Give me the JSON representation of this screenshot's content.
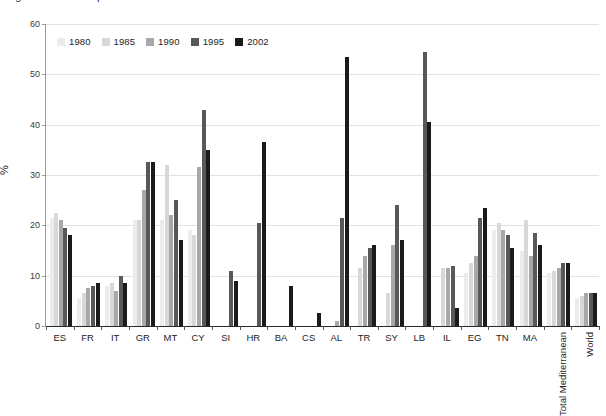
{
  "caption": {
    "text": "Figure 6.  Share of protected areas in the Mediterranean countries"
  },
  "chart_data": {
    "type": "bar",
    "title": "",
    "xlabel": "",
    "ylabel": "%",
    "ylim": [
      0,
      60
    ],
    "yticks": [
      0,
      10,
      20,
      30,
      40,
      50,
      60
    ],
    "grid": true,
    "legend_position": "top-left",
    "categories": [
      "ES",
      "FR",
      "IT",
      "GR",
      "MT",
      "CY",
      "SI",
      "HR",
      "BA",
      "CS",
      "AL",
      "TR",
      "SY",
      "LB",
      "IL",
      "EG",
      "TN",
      "MA",
      "Total Mediterranean",
      "World"
    ],
    "rotated_categories": [
      "Total Mediterranean",
      "World"
    ],
    "series": [
      {
        "name": "1980",
        "color": "#ececec",
        "values": [
          21.5,
          5.5,
          8.0,
          21.0,
          21.0,
          19.0,
          null,
          null,
          null,
          null,
          null,
          null,
          null,
          null,
          null,
          10.5,
          19.0,
          15.0,
          10.5,
          5.5
        ]
      },
      {
        "name": "1985",
        "color": "#d8d8d8",
        "values": [
          22.5,
          6.5,
          8.5,
          21.0,
          32.0,
          18.0,
          null,
          null,
          null,
          null,
          null,
          11.5,
          6.5,
          null,
          11.5,
          12.5,
          20.5,
          21.0,
          11.0,
          6.0
        ]
      },
      {
        "name": "1990",
        "color": "#a8a8a8",
        "values": [
          21.0,
          7.5,
          7.0,
          27.0,
          22.0,
          31.5,
          null,
          null,
          null,
          null,
          1.0,
          14.0,
          16.0,
          null,
          11.5,
          14.0,
          19.0,
          14.0,
          11.5,
          6.5
        ]
      },
      {
        "name": "1995",
        "color": "#585858",
        "values": [
          19.5,
          8.0,
          10.0,
          32.5,
          25.0,
          43.0,
          11.0,
          20.5,
          null,
          null,
          21.5,
          15.5,
          24.0,
          54.5,
          12.0,
          21.5,
          18.0,
          18.5,
          12.5,
          6.5
        ]
      },
      {
        "name": "2002",
        "color": "#1a1a1a",
        "values": [
          18.0,
          8.5,
          8.5,
          32.5,
          17.0,
          35.0,
          9.0,
          36.5,
          8.0,
          2.5,
          53.5,
          16.0,
          17.0,
          40.5,
          3.5,
          23.5,
          15.5,
          16.0,
          12.5,
          6.5
        ]
      }
    ]
  }
}
